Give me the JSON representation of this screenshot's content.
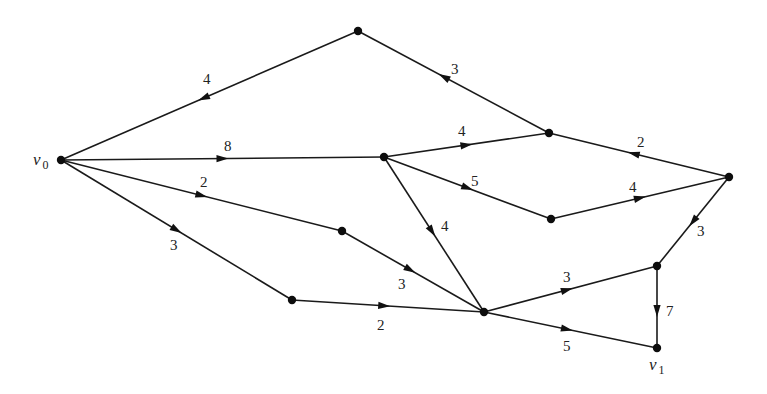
{
  "diagram": {
    "type": "directed-weighted-graph",
    "nodes": [
      {
        "id": "v0",
        "label": "v",
        "subscript": "0",
        "x": 61,
        "y": 160,
        "label_x": 33,
        "label_y": 165
      },
      {
        "id": "A",
        "label": "",
        "x": 358,
        "y": 31
      },
      {
        "id": "B",
        "label": "",
        "x": 384,
        "y": 157
      },
      {
        "id": "C",
        "label": "",
        "x": 549,
        "y": 133
      },
      {
        "id": "D",
        "label": "",
        "x": 729,
        "y": 177
      },
      {
        "id": "E",
        "label": "",
        "x": 551,
        "y": 219
      },
      {
        "id": "F",
        "label": "",
        "x": 342,
        "y": 231
      },
      {
        "id": "G",
        "label": "",
        "x": 292,
        "y": 300
      },
      {
        "id": "H",
        "label": "",
        "x": 484,
        "y": 312
      },
      {
        "id": "I",
        "label": "",
        "x": 657,
        "y": 266
      },
      {
        "id": "v1",
        "label": "v",
        "subscript": "1",
        "x": 657,
        "y": 348,
        "label_x": 649,
        "label_y": 370
      }
    ],
    "edges": [
      {
        "from": "A",
        "to": "v0",
        "weight": "4",
        "label_x": 203,
        "label_y": 84,
        "arrow_t": 0.52
      },
      {
        "from": "C",
        "to": "A",
        "weight": "3",
        "label_x": 451,
        "label_y": 74,
        "arrow_t": 0.55
      },
      {
        "from": "v0",
        "to": "B",
        "weight": "8",
        "label_x": 224,
        "label_y": 151,
        "arrow_t": 0.5
      },
      {
        "from": "B",
        "to": "C",
        "weight": "4",
        "label_x": 458,
        "label_y": 136,
        "arrow_t": 0.5
      },
      {
        "from": "D",
        "to": "C",
        "weight": "2",
        "label_x": 637,
        "label_y": 147,
        "arrow_t": 0.53
      },
      {
        "from": "B",
        "to": "E",
        "weight": "5",
        "label_x": 471,
        "label_y": 186,
        "arrow_t": 0.5
      },
      {
        "from": "E",
        "to": "D",
        "weight": "4",
        "label_x": 629,
        "label_y": 192,
        "arrow_t": 0.5
      },
      {
        "from": "B",
        "to": "H",
        "weight": "4",
        "label_x": 441,
        "label_y": 231,
        "arrow_t": 0.48
      },
      {
        "from": "v0",
        "to": "F",
        "weight": "2",
        "label_x": 200,
        "label_y": 187,
        "arrow_t": 0.5
      },
      {
        "from": "F",
        "to": "H",
        "weight": "3",
        "label_x": 398,
        "label_y": 289,
        "arrow_t": 0.48
      },
      {
        "from": "v0",
        "to": "G",
        "weight": "3",
        "label_x": 170,
        "label_y": 250,
        "arrow_t": 0.5
      },
      {
        "from": "G",
        "to": "H",
        "weight": "2",
        "label_x": 377,
        "label_y": 330,
        "arrow_t": 0.48
      },
      {
        "from": "D",
        "to": "I",
        "weight": "3",
        "label_x": 697,
        "label_y": 236,
        "arrow_t": 0.5
      },
      {
        "from": "H",
        "to": "I",
        "weight": "3",
        "label_x": 563,
        "label_y": 282,
        "arrow_t": 0.48
      },
      {
        "from": "H",
        "to": "v1",
        "weight": "5",
        "label_x": 563,
        "label_y": 351,
        "arrow_t": 0.48
      },
      {
        "from": "I",
        "to": "v1",
        "weight": "7",
        "label_x": 666,
        "label_y": 316,
        "arrow_t": 0.55
      }
    ]
  }
}
